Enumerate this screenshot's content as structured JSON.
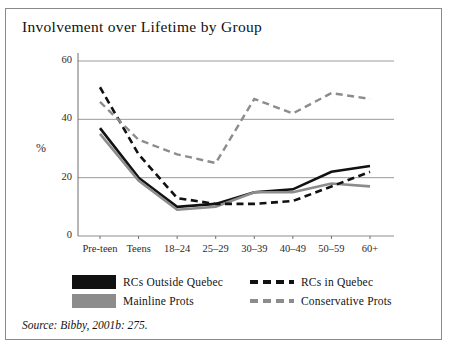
{
  "figure": {
    "title": "Involvement over Lifetime by Group",
    "source": "Source: Bibby, 2001b: 275."
  },
  "chart_data": {
    "type": "line",
    "title": "Involvement over Lifetime by Group",
    "xlabel": "",
    "ylabel": "%",
    "ylim": [
      0,
      60
    ],
    "yticks": [
      0,
      20,
      40,
      60
    ],
    "ytick_labels": [
      "0",
      "20",
      "40",
      "60"
    ],
    "grid": true,
    "legend_position": "below",
    "categories": [
      "Pre-teen",
      "Teens",
      "18–24",
      "25–29",
      "30–39",
      "40–49",
      "50–59",
      "60+"
    ],
    "series": [
      {
        "name": "RCs Outside Quebec",
        "style": "solid",
        "color": "#111111",
        "width": 2.6,
        "values": [
          37,
          20,
          10,
          11,
          15,
          16,
          22,
          24
        ]
      },
      {
        "name": "Mainline Prots",
        "style": "solid",
        "color": "#8c8c8c",
        "width": 2.6,
        "values": [
          35,
          19,
          9,
          10,
          15,
          15,
          18,
          17
        ]
      },
      {
        "name": "RCs in Quebec",
        "style": "dashed",
        "color": "#111111",
        "width": 2.6,
        "values": [
          51,
          28,
          13,
          11,
          11,
          12,
          17,
          22
        ]
      },
      {
        "name": "Conservative Prots",
        "style": "dashed",
        "color": "#8c8c8c",
        "width": 2.4,
        "values": [
          46,
          33,
          28,
          25,
          47,
          42,
          49,
          47
        ]
      }
    ]
  },
  "legend": {
    "items": [
      {
        "label": "RCs Outside Quebec",
        "style": "solid",
        "color": "#111111"
      },
      {
        "label": "RCs in Quebec",
        "style": "dashed",
        "color": "#111111"
      },
      {
        "label": "Mainline Prots",
        "style": "solid",
        "color": "#8c8c8c"
      },
      {
        "label": "Conservative Prots",
        "style": "dashed",
        "color": "#8c8c8c"
      }
    ]
  }
}
